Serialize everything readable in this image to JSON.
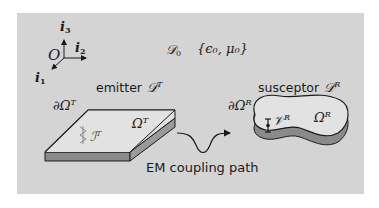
{
  "axes": {
    "origin": "O",
    "i1": {
      "base": "i",
      "sub": "1"
    },
    "i2": {
      "base": "i",
      "sub": "2"
    },
    "i3": {
      "base": "i",
      "sub": "3"
    }
  },
  "domain": {
    "label_base": "𝒟",
    "label_sub": "0",
    "params": "{ϵ₀, μ₀}"
  },
  "emitter": {
    "title": "emitter",
    "symbol_base": "𝒟",
    "symbol_sup": "T",
    "boundary_base": "∂Ω",
    "boundary_sup": "T",
    "region_base": "Ω",
    "region_sup": "T",
    "source_base": "ℐ",
    "source_sup": "T"
  },
  "susceptor": {
    "title": "susceptor",
    "symbol_base": "𝒟",
    "symbol_sup": "R",
    "boundary_base": "∂Ω",
    "boundary_sup": "R",
    "region_base": "Ω",
    "region_sup": "R",
    "source_base": "𝒱",
    "source_sup": "R"
  },
  "coupling": {
    "label": "EM coupling path"
  },
  "colors": {
    "panel": "#d4d4d4",
    "plate_top": "#e2e2e2",
    "plate_side": "#8a8a8a",
    "outline": "#1a1a1a"
  }
}
